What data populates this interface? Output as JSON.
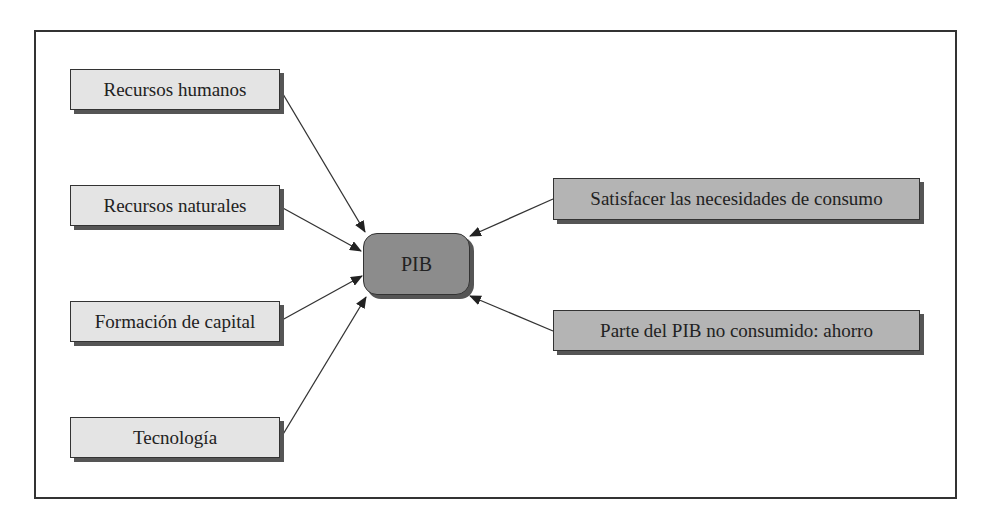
{
  "diagram": {
    "center": {
      "label": "PIB",
      "color": "#8c8c8c"
    },
    "inputs": [
      {
        "label": "Recursos humanos"
      },
      {
        "label": "Recursos naturales"
      },
      {
        "label": "Formación de capital"
      },
      {
        "label": "Tecnología"
      }
    ],
    "uses": [
      {
        "label": "Satisfacer las necesidades de consumo"
      },
      {
        "label": "Parte del PIB no consumido: ahorro"
      }
    ],
    "colors": {
      "input_fill": "#e4e4e4",
      "use_fill": "#b4b4b4",
      "border": "#333333"
    }
  }
}
